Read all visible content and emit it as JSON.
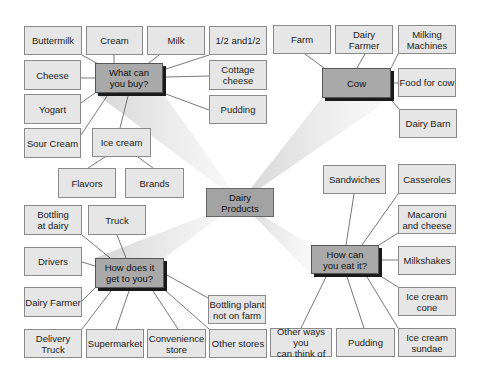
{
  "diagram": {
    "title": "Dairy Products",
    "center": {
      "label": "Dairy\nProducts",
      "x": 206,
      "y": 188,
      "w": 68,
      "h": 29
    },
    "beams": [
      {
        "to": "buy",
        "points": "240,202 95,93 163,93"
      },
      {
        "to": "cow",
        "points": "240,202 322,98 391,98"
      },
      {
        "to": "get",
        "points": "240,202 95,258 164,258"
      },
      {
        "to": "eat",
        "points": "240,202 311,245 311,274"
      }
    ],
    "colors": {
      "leaf_fill": "#e6e6e6",
      "leaf_border": "#8a8a8a",
      "hub_fill": "#a9a9a9",
      "hub_shadow": "#1a1a1a",
      "center_fill": "#a3a3a3",
      "beam": "#c8c8c8",
      "connector": "#555555"
    },
    "groups": {
      "buy": {
        "hub": {
          "label": "What can\nyou buy?",
          "x": 95,
          "y": 63,
          "w": 68,
          "h": 30
        },
        "leaves": [
          {
            "label": "Buttermilk",
            "x": 24,
            "y": 26,
            "w": 58,
            "h": 29,
            "line": [
              82,
              55,
              100,
              65
            ]
          },
          {
            "label": "Cream",
            "x": 86,
            "y": 26,
            "w": 57,
            "h": 29,
            "line": [
              114,
              55,
              114,
              63
            ]
          },
          {
            "label": "Milk",
            "x": 147,
            "y": 26,
            "w": 58,
            "h": 29,
            "line": [
              159,
              55,
              149,
              63
            ]
          },
          {
            "label": "1/2 and1/2",
            "x": 209,
            "y": 26,
            "w": 58,
            "h": 29,
            "line": [
              209,
              55,
              166,
              69
            ]
          },
          {
            "label": "Cheese",
            "x": 24,
            "y": 60,
            "w": 57,
            "h": 30,
            "line": [
              81,
              78,
              95,
              78
            ]
          },
          {
            "label": "Cottage\ncheese",
            "x": 209,
            "y": 60,
            "w": 58,
            "h": 30,
            "line": [
              166,
              77,
              209,
              76
            ]
          },
          {
            "label": "Yogart",
            "x": 24,
            "y": 94,
            "w": 57,
            "h": 30,
            "line": [
              81,
              103,
              95,
              93
            ]
          },
          {
            "label": "Pudding",
            "x": 209,
            "y": 95,
            "w": 58,
            "h": 29,
            "line": [
              166,
              94,
              209,
              110
            ]
          },
          {
            "label": "Sour Cream",
            "x": 24,
            "y": 128,
            "w": 57,
            "h": 30,
            "line": [
              81,
              135,
              107,
              96
            ]
          },
          {
            "label": "Ice cream",
            "x": 92,
            "y": 128,
            "w": 59,
            "h": 29,
            "line": [
              120,
              128,
              128,
              96
            ]
          },
          {
            "label": "Flavors",
            "x": 58,
            "y": 168,
            "w": 58,
            "h": 30,
            "line": [
              88,
              168,
              105,
              157
            ]
          },
          {
            "label": "Brands",
            "x": 125,
            "y": 168,
            "w": 59,
            "h": 30,
            "line": [
              153,
              168,
              138,
              157
            ]
          }
        ]
      },
      "cow": {
        "hub": {
          "label": "Cow",
          "x": 322,
          "y": 68,
          "w": 69,
          "h": 30
        },
        "leaves": [
          {
            "label": "Farm",
            "x": 273,
            "y": 25,
            "w": 58,
            "h": 29,
            "line": [
              305,
              54,
              324,
              68
            ]
          },
          {
            "label": "Dairy\nFarmer",
            "x": 335,
            "y": 25,
            "w": 58,
            "h": 29,
            "line": [
              365,
              54,
              357,
              68
            ]
          },
          {
            "label": "Milking\nMachines",
            "x": 398,
            "y": 25,
            "w": 58,
            "h": 29,
            "line": [
              398,
              54,
              391,
              68
            ]
          },
          {
            "label": "Food for cow",
            "x": 398,
            "y": 68,
            "w": 58,
            "h": 29,
            "line": [
              394,
              83,
              398,
              83
            ]
          },
          {
            "label": "Dairy Barn",
            "x": 399,
            "y": 109,
            "w": 58,
            "h": 29,
            "line": [
              392,
              101,
              399,
              109
            ]
          }
        ]
      },
      "eat": {
        "hub": {
          "label": "How can\nyou eat it?",
          "x": 311,
          "y": 245,
          "w": 68,
          "h": 29
        },
        "leaves": [
          {
            "label": "Sandwiches",
            "x": 323,
            "y": 165,
            "w": 63,
            "h": 29,
            "line": [
              354,
              194,
              346,
              245
            ]
          },
          {
            "label": "Casseroles",
            "x": 398,
            "y": 164,
            "w": 58,
            "h": 30,
            "line": [
              398,
              194,
              362,
              245
            ]
          },
          {
            "label": "Macaroni\nand cheese",
            "x": 398,
            "y": 205,
            "w": 58,
            "h": 29,
            "line": [
              398,
              233,
              379,
              245
            ]
          },
          {
            "label": "Milkshakes",
            "x": 398,
            "y": 246,
            "w": 58,
            "h": 29,
            "line": [
              382,
              260,
              398,
              260
            ]
          },
          {
            "label": "Ice cream\ncone",
            "x": 398,
            "y": 287,
            "w": 58,
            "h": 29,
            "line": [
              382,
              277,
              398,
              287
            ]
          },
          {
            "label": "Other ways you\ncan think of",
            "x": 270,
            "y": 328,
            "w": 62,
            "h": 29,
            "line": [
              301,
              328,
              326,
              277
            ]
          },
          {
            "label": "Pudding",
            "x": 336,
            "y": 328,
            "w": 59,
            "h": 29,
            "line": [
              364,
              328,
              347,
              277
            ]
          },
          {
            "label": "Ice cream\nsundae",
            "x": 398,
            "y": 328,
            "w": 58,
            "h": 29,
            "line": [
              398,
              328,
              367,
              277
            ]
          }
        ]
      },
      "get": {
        "hub": {
          "label": "How does it\nget to you?",
          "x": 95,
          "y": 258,
          "w": 69,
          "h": 30
        },
        "leaves": [
          {
            "label": "Bottling\nat dairy",
            "x": 24,
            "y": 205,
            "w": 58,
            "h": 30,
            "line": [
              82,
              235,
              110,
              258
            ]
          },
          {
            "label": "Truck",
            "x": 88,
            "y": 205,
            "w": 58,
            "h": 30,
            "line": [
              117,
              235,
              126,
              258
            ]
          },
          {
            "label": "Drivers",
            "x": 24,
            "y": 247,
            "w": 58,
            "h": 29,
            "line": [
              82,
              262,
              95,
              266
            ]
          },
          {
            "label": "Dairy Farmer",
            "x": 24,
            "y": 287,
            "w": 58,
            "h": 30,
            "line": [
              82,
              301,
              95,
              288
            ]
          },
          {
            "label": "Bottling plant\nnot on farm",
            "x": 208,
            "y": 295,
            "w": 58,
            "h": 29,
            "line": [
              167,
              275,
              208,
              298
            ]
          },
          {
            "label": "Delivery Truck",
            "x": 24,
            "y": 329,
            "w": 58,
            "h": 29,
            "line": [
              82,
              329,
              111,
              291
            ]
          },
          {
            "label": "Supermarket",
            "x": 86,
            "y": 329,
            "w": 58,
            "h": 29,
            "line": [
              116,
              329,
              129,
              291
            ]
          },
          {
            "label": "Convenience\nstore",
            "x": 147,
            "y": 329,
            "w": 59,
            "h": 29,
            "line": [
              178,
              329,
              153,
              291
            ]
          },
          {
            "label": "Other stores",
            "x": 209,
            "y": 329,
            "w": 58,
            "h": 29,
            "line": [
              209,
              329,
              166,
              291
            ]
          }
        ]
      }
    }
  }
}
